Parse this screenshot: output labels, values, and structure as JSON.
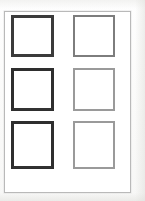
{
  "page": {
    "kind": "scanned-grid-sheet",
    "width": 145,
    "height": 201,
    "background_color": "#fdfdfc",
    "surround_color": "#fbfbfa"
  },
  "sheet": {
    "name": "sheet-frame",
    "border_color": "#b9b9b9",
    "fill_color": "#ffffff",
    "x": 4,
    "y": 11,
    "width": 127,
    "height": 182
  },
  "grid": {
    "columns": 2,
    "rows": 3,
    "cell_count": 6,
    "cells": [
      {
        "id": "cell-r1c1",
        "row": 1,
        "column": 1,
        "label": "",
        "x": 10,
        "y": 14,
        "width": 43,
        "height": 42,
        "weight": "weight-dark",
        "border_color": "#3b3b3b",
        "fill_color": "#ffffff"
      },
      {
        "id": "cell-r1c2",
        "row": 1,
        "column": 2,
        "label": "",
        "x": 72,
        "y": 14,
        "width": 42,
        "height": 42,
        "weight": "weight-medium",
        "border_color": "#7d7d7d",
        "fill_color": "#ffffff"
      },
      {
        "id": "cell-r2c1",
        "row": 2,
        "column": 1,
        "label": "",
        "x": 10,
        "y": 67,
        "width": 43,
        "height": 43,
        "weight": "weight-darkest",
        "border_color": "#2e2e2e",
        "fill_color": "#ffffff"
      },
      {
        "id": "cell-r2c2",
        "row": 2,
        "column": 2,
        "label": "",
        "x": 72,
        "y": 67,
        "width": 42,
        "height": 43,
        "weight": "weight-light",
        "border_color": "#9a9a9a",
        "fill_color": "#ffffff"
      },
      {
        "id": "cell-r3c1",
        "row": 3,
        "column": 1,
        "label": "",
        "x": 10,
        "y": 120,
        "width": 43,
        "height": 48,
        "weight": "weight-darkest",
        "border_color": "#2e2e2e",
        "fill_color": "#ffffff"
      },
      {
        "id": "cell-r3c2",
        "row": 3,
        "column": 2,
        "label": "",
        "x": 72,
        "y": 120,
        "width": 42,
        "height": 48,
        "weight": "weight-light",
        "border_color": "#9a9a9a",
        "fill_color": "#ffffff"
      }
    ]
  }
}
